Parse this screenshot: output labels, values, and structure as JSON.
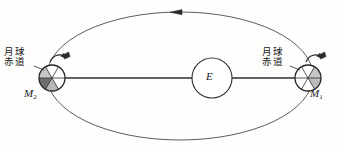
{
  "figure": {
    "name": "moon-orbit-tidal-locking-diagram",
    "background_color": "#fdfdfc",
    "stroke_color": "#3a3a3a",
    "shade_color": "#c9c9c9",
    "dark_shade_color": "#6e6e6e",
    "width": 338,
    "height": 152
  },
  "orbit": {
    "label": "moon-orbit-ellipse",
    "center_x": 180,
    "center_y": 76,
    "radius_x": 133,
    "radius_y": 64,
    "direction_arrow": {
      "name": "orbit-direction-arrow",
      "x": 178,
      "y": 13,
      "points": "left"
    }
  },
  "earth": {
    "symbol": "E",
    "center_x": 212,
    "center_y": 78,
    "radius": 20
  },
  "moons": [
    {
      "id": "m1",
      "symbol": "M",
      "subscript": "1",
      "equator_label_line1": "月球",
      "equator_label_line2": "赤道",
      "center_x": 308,
      "center_y": 78,
      "radius": 13,
      "rotation_arrow": "rotation-arrow-clockwise"
    },
    {
      "id": "m2",
      "symbol": "M",
      "subscript": "2",
      "equator_label_line1": "月球",
      "equator_label_line2": "赤道",
      "center_x": 52,
      "center_y": 78,
      "radius": 13,
      "rotation_arrow": "rotation-arrow-clockwise"
    }
  ],
  "connector_line": {
    "name": "earth-moon-axis-line",
    "x1": 52,
    "y1": 78,
    "x2": 308,
    "y2": 78
  }
}
